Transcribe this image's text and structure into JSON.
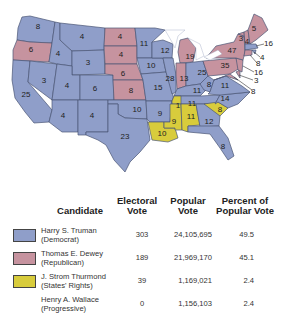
{
  "colors": {
    "democrat": "#8f9ec9",
    "republican": "#c6939f",
    "states_rights": "#d8cc3c",
    "progressive": "#ffffff",
    "border": "#4a5676"
  },
  "map": {
    "title": "1948 Presidential Election",
    "states": [
      {
        "abbr": "WA",
        "votes": "8",
        "party": "democrat"
      },
      {
        "abbr": "OR",
        "votes": "6",
        "party": "republican"
      },
      {
        "abbr": "CA",
        "votes": "25",
        "party": "democrat"
      },
      {
        "abbr": "ID",
        "votes": "4",
        "party": "democrat"
      },
      {
        "abbr": "NV",
        "votes": "3",
        "party": "democrat"
      },
      {
        "abbr": "MT",
        "votes": "4",
        "party": "democrat"
      },
      {
        "abbr": "WY",
        "votes": "3",
        "party": "democrat"
      },
      {
        "abbr": "UT",
        "votes": "4",
        "party": "democrat"
      },
      {
        "abbr": "CO",
        "votes": "6",
        "party": "democrat"
      },
      {
        "abbr": "AZ",
        "votes": "4",
        "party": "democrat"
      },
      {
        "abbr": "NM",
        "votes": "4",
        "party": "democrat"
      },
      {
        "abbr": "ND",
        "votes": "4",
        "party": "republican"
      },
      {
        "abbr": "SD",
        "votes": "4",
        "party": "republican"
      },
      {
        "abbr": "NE",
        "votes": "6",
        "party": "republican"
      },
      {
        "abbr": "KS",
        "votes": "8",
        "party": "republican"
      },
      {
        "abbr": "OK",
        "votes": "10",
        "party": "democrat"
      },
      {
        "abbr": "TX",
        "votes": "23",
        "party": "democrat"
      },
      {
        "abbr": "MN",
        "votes": "11",
        "party": "democrat"
      },
      {
        "abbr": "IA",
        "votes": "10",
        "party": "democrat"
      },
      {
        "abbr": "MO",
        "votes": "15",
        "party": "democrat"
      },
      {
        "abbr": "AR",
        "votes": "9",
        "party": "democrat"
      },
      {
        "abbr": "LA",
        "votes": "10",
        "party": "states_rights"
      },
      {
        "abbr": "WI",
        "votes": "12",
        "party": "democrat"
      },
      {
        "abbr": "IL",
        "votes": "28",
        "party": "democrat"
      },
      {
        "abbr": "MI",
        "votes": "19",
        "party": "republican"
      },
      {
        "abbr": "IN",
        "votes": "13",
        "party": "republican"
      },
      {
        "abbr": "OH",
        "votes": "25",
        "party": "democrat"
      },
      {
        "abbr": "KY",
        "votes": "11",
        "party": "democrat"
      },
      {
        "abbr": "TN",
        "votes": "11",
        "party": "democrat"
      },
      {
        "abbr": "TN-split",
        "votes": "1",
        "party": "states_rights"
      },
      {
        "abbr": "MS",
        "votes": "9",
        "party": "states_rights"
      },
      {
        "abbr": "AL",
        "votes": "11",
        "party": "states_rights"
      },
      {
        "abbr": "GA",
        "votes": "12",
        "party": "democrat"
      },
      {
        "abbr": "FL",
        "votes": "8",
        "party": "democrat"
      },
      {
        "abbr": "SC",
        "votes": "8",
        "party": "states_rights"
      },
      {
        "abbr": "NC",
        "votes": "14",
        "party": "democrat"
      },
      {
        "abbr": "VA",
        "votes": "11",
        "party": "democrat"
      },
      {
        "abbr": "WV",
        "votes": "8",
        "party": "democrat"
      },
      {
        "abbr": "PA",
        "votes": "35",
        "party": "republican"
      },
      {
        "abbr": "NY",
        "votes": "47",
        "party": "republican"
      },
      {
        "abbr": "VT",
        "votes": "3",
        "party": "republican"
      },
      {
        "abbr": "NH",
        "votes": "4",
        "party": "republican"
      },
      {
        "abbr": "ME",
        "votes": "5",
        "party": "republican"
      },
      {
        "abbr": "MA",
        "votes": "16",
        "party": "democrat"
      },
      {
        "abbr": "RI",
        "votes": "4",
        "party": "democrat"
      },
      {
        "abbr": "CT",
        "votes": "8",
        "party": "republican"
      },
      {
        "abbr": "NJ",
        "votes": "16",
        "party": "republican"
      },
      {
        "abbr": "DE",
        "votes": "3",
        "party": "republican"
      },
      {
        "abbr": "MD",
        "votes": "8",
        "party": "republican"
      }
    ],
    "callouts": [
      "16",
      "4",
      "8",
      "16",
      "3",
      "8"
    ]
  },
  "legend": {
    "headers": {
      "candidate": "Candidate",
      "electoral_line1": "Electoral",
      "electoral_line2": "Vote",
      "popular_line1": "Popular",
      "popular_line2": "Vote",
      "percent_line1": "Percent of",
      "percent_line2": "Popular Vote"
    },
    "rows": [
      {
        "name": "Harry S. Truman",
        "party": "(Democrat)",
        "electoral": "303",
        "popular": "24,105,695",
        "percent": "49.5",
        "color_key": "democrat"
      },
      {
        "name": "Thomas E. Dewey",
        "party": "(Republican)",
        "electoral": "189",
        "popular": "21,969,170",
        "percent": "45.1",
        "color_key": "republican"
      },
      {
        "name": "J. Strom Thurmond",
        "party": "(States' Rights)",
        "electoral": "39",
        "popular": "1,169,021",
        "percent": "2.4",
        "color_key": "states_rights"
      },
      {
        "name": "Henry A. Wallace",
        "party": "(Progressive)",
        "electoral": "0",
        "popular": "1,156,103",
        "percent": "2.4",
        "color_key": "progressive"
      }
    ]
  }
}
